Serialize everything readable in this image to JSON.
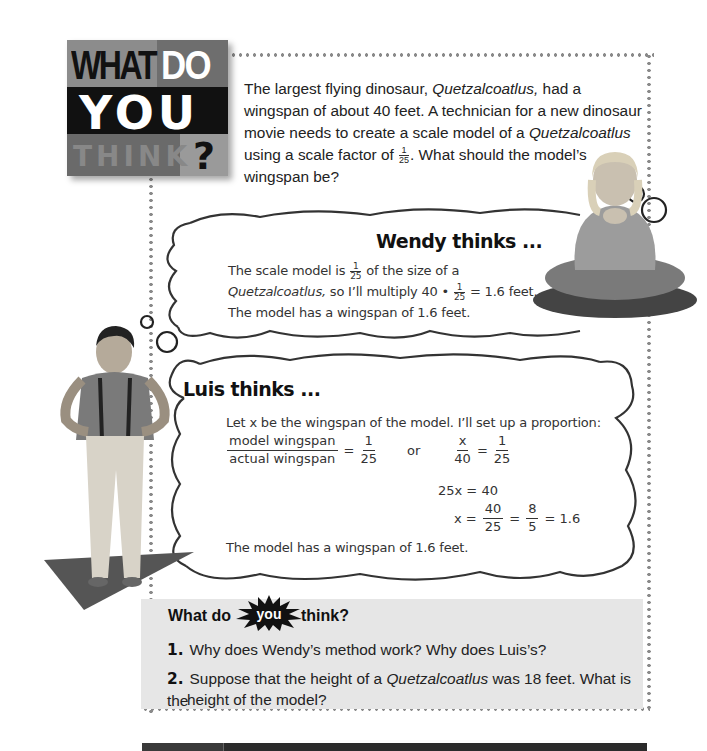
{
  "logo": {
    "line1a": "WHAT",
    "line1b": "DO",
    "line2": "YOU",
    "line3": "THINK",
    "question_mark": "?"
  },
  "intro": {
    "p1_a": "The largest flying dinosaur, ",
    "p1_species": "Quetzalcoatlus,",
    "p1_b": " had a wingspan of about 40 feet. A technician for a new dinosaur movie needs to create a scale model of a ",
    "p1_species2": "Quetzalcoatlus",
    "p1_c": " using a scale factor of ",
    "scale_num": "1",
    "scale_den": "25",
    "p1_d": ". What should the model’s wingspan be?"
  },
  "wendy": {
    "title": "Wendy thinks ...",
    "line1_a": "The scale model is ",
    "frac_num": "1",
    "frac_den": "25",
    "line1_b": " of the size of a",
    "line2_species": "Quetzalcoatlus,",
    "line2_a": " so I’ll multiply 40 • ",
    "line2_b": " = 1.6 feet.",
    "line3": "The model has a wingspan of 1.6 feet."
  },
  "luis": {
    "title": "Luis thinks ...",
    "line1": "Let x be the wingspan of the model. I’ll set up a proportion:",
    "eq1_num": "model wingspan",
    "eq1_den": "actual wingspan",
    "eq1_eq": "=",
    "eq1_rnum": "1",
    "eq1_rden": "25",
    "or": "or",
    "eq2_num": "x",
    "eq2_den": "40",
    "eq2_eq": "=",
    "eq2_rnum": "1",
    "eq2_rden": "25",
    "eq3": "25x = 40",
    "eq4_lhs": "x =",
    "eq4_f1_num": "40",
    "eq4_f1_den": "25",
    "eq4_eq": "=",
    "eq4_f2_num": "8",
    "eq4_f2_den": "5",
    "eq4_rhs": "= 1.6",
    "conclusion": "The model has a wingspan of 1.6 feet."
  },
  "questions": {
    "title_a": "What do",
    "title_you": "you",
    "title_b": "think?",
    "items": [
      {
        "num": "1.",
        "text": "Why does Wendy’s method work? Why does Luis’s?"
      },
      {
        "num": "2.",
        "text_a": "Suppose that the height of a ",
        "species": "Quetzalcoatlus",
        "text_b": " was 18 feet. What is the",
        "text_c": "height of the model?"
      }
    ]
  },
  "colors": {
    "dot": "#8a8a8a",
    "question_box": "#e6e6e6",
    "cloud_stroke": "#333333",
    "ground_shadow": "#555555"
  }
}
